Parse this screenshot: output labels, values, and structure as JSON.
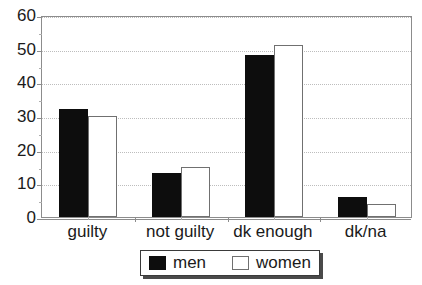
{
  "chart_data": {
    "type": "bar",
    "title": "",
    "xlabel": "",
    "ylabel": "",
    "categories": [
      "guilty",
      "not guilty",
      "dk enough",
      "dk/na"
    ],
    "series": [
      {
        "name": "men",
        "color": "#0d0d0d",
        "values": [
          32,
          13,
          48,
          6
        ]
      },
      {
        "name": "women",
        "color": "#ffffff",
        "values": [
          30,
          15,
          51,
          4
        ]
      }
    ],
    "ylim": [
      0,
      60
    ],
    "yticks": [
      0,
      10,
      20,
      30,
      40,
      50,
      60
    ],
    "ytick_labels": [
      "0",
      "10",
      "20",
      "30",
      "40",
      "50",
      "60"
    ],
    "y_minor_step": 5,
    "grid": true,
    "grid_axis": "y",
    "grid_style": "dotted",
    "grid_color": "#bdbdbd",
    "legend_position": "bottom",
    "axis_color": "#8c8c8c",
    "background": "#ffffff"
  },
  "legend": {
    "entries": [
      {
        "label": "men",
        "swatch": "men"
      },
      {
        "label": "women",
        "swatch": "women"
      }
    ]
  },
  "title_remnant": ""
}
